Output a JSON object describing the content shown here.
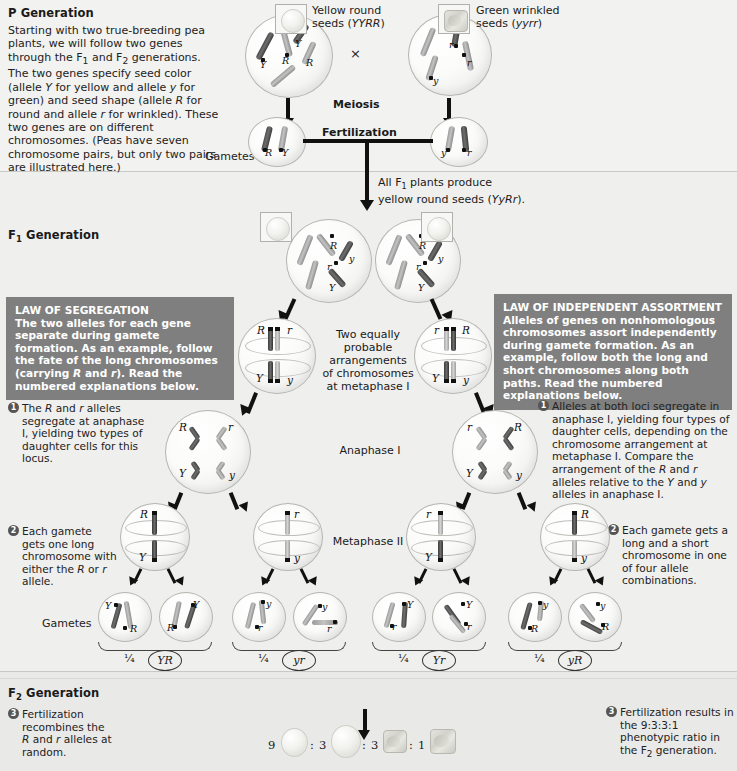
{
  "p_generation": {
    "heading": "P Generation",
    "heading_sub": "",
    "intro": "Starting with two true-breeding pea plants, we will follow two genes through the F1 and F2 generations. The two genes specify seed color (allele Y for yellow and allele y for green) and seed shape (allele R for round and allele r for wrinkled). These two genes are on different chromosomes. (Peas have seven chromosome pairs, but only two pairs are illustrated here.)",
    "parent_left_label": "Yellow round seeds (YYRR)",
    "parent_right_label": "Green wrinkled seeds (yyrr)",
    "cross_symbol": "×",
    "meiosis_label": "Meiosis",
    "fertilization_label": "Fertilization",
    "gametes_label": "Gametes",
    "parent_left_alleles": [
      "Y",
      "Y",
      "R",
      "R"
    ],
    "parent_right_alleles": [
      "y",
      "y",
      "r",
      "r"
    ],
    "gamete_left_alleles": [
      "R",
      "Y"
    ],
    "gamete_right_alleles": [
      "y",
      "r"
    ]
  },
  "f1_generation": {
    "heading": "F1 Generation",
    "all_f1_note": "All F1 plants produce yellow round seeds (YyRr).",
    "meiosis_label": "Meiosis",
    "metaphase1_note": "Two equally probable arrangements of chromosomes at metaphase I",
    "anaphase1_label": "Anaphase I",
    "metaphase2_label": "Metaphase II",
    "gametes_label": "Gametes",
    "f1_cell_alleles": [
      "R",
      "y",
      "r",
      "Y"
    ],
    "law_segregation": {
      "title": "LAW OF SEGREGATION",
      "body": "The two alleles for each gene separate during gamete formation. As an example, follow the fate of the long chromosomes (carrying R and r). Read the numbered explanations below."
    },
    "law_independent_assortment": {
      "title": "LAW OF INDEPENDENT ASSORTMENT",
      "body": "Alleles of genes on nonhomologous chromosomes assort independently during gamete formation. As an example, follow both the long and short chromosomes along both paths. Read the numbered explanations below."
    },
    "callout_left_1": {
      "number": "1",
      "text": "The R and r alleles segregate at anaphase I, yielding two types of daughter cells for this locus."
    },
    "callout_left_2": {
      "number": "2",
      "text": "Each gamete gets one long chromosome with either the R or r allele."
    },
    "callout_right_1": {
      "number": "1",
      "text": "Alleles at both loci segregate in anaphase I, yielding four types of daughter cells, depending on the chromosome arrangement at metaphase I. Compare the arrangement of the R and r alleles relative to the Y and y alleles in anaphase I."
    },
    "callout_right_2": {
      "number": "2",
      "text": "Each gamete gets a long and a short chromosome in one of four allele combinations."
    },
    "metaphase1_cells": [
      {
        "top_left": "R",
        "top_right": "r",
        "bottom_left": "Y",
        "bottom_right": "y"
      },
      {
        "top_left": "r",
        "top_right": "R",
        "bottom_left": "Y",
        "bottom_right": "y"
      }
    ],
    "anaphase1_cells": [
      {
        "top_left": "R",
        "top_right": "r",
        "bottom_left": "Y",
        "bottom_right": "y"
      },
      {
        "top_left": "r",
        "top_right": "R",
        "bottom_left": "Y",
        "bottom_right": "y"
      }
    ],
    "metaphase2_cells": [
      {
        "top": "R",
        "bottom": "Y"
      },
      {
        "top": "r",
        "bottom": "y"
      },
      {
        "top": "r",
        "bottom": "Y"
      },
      {
        "top": "R",
        "bottom": "y"
      }
    ],
    "gamete_groups": [
      {
        "fraction": "1/4",
        "genotype": "YR",
        "cells": [
          {
            "a": "Y",
            "b": "R"
          },
          {
            "a": "Y",
            "b": "R"
          }
        ]
      },
      {
        "fraction": "1/4",
        "genotype": "yr",
        "cells": [
          {
            "a": "y",
            "b": "r"
          },
          {
            "a": "y",
            "b": "r"
          }
        ]
      },
      {
        "fraction": "1/4",
        "genotype": "Yr",
        "cells": [
          {
            "a": "Y",
            "b": "r"
          },
          {
            "a": "Y",
            "b": "r"
          }
        ]
      },
      {
        "fraction": "1/4",
        "genotype": "yR",
        "cells": [
          {
            "a": "y",
            "b": "R"
          },
          {
            "a": "y",
            "b": "R"
          }
        ]
      }
    ]
  },
  "f2_generation": {
    "heading": "F2 Generation",
    "cross_box": "An F1 × F1 cross-fertilization",
    "callout_left": {
      "number": "3",
      "text": "Fertilization recombines the R and r alleles at random."
    },
    "callout_right": {
      "number": "3",
      "text": "Fertilization results in the 9:3:3:1 phenotypic ratio in the F2 generation."
    },
    "ratio": {
      "counts": [
        "9",
        "3",
        "3",
        "1"
      ],
      "separator": ":",
      "phenotypes": [
        "yellow-round",
        "green-round",
        "yellow-wrinkled",
        "green-wrinkled"
      ],
      "text": "9 : 3 : 3 : 1"
    }
  },
  "colors": {
    "law_box_bg": "#7f7f7f",
    "band_p": "#f2f2f0",
    "band_f1": "#efefed",
    "band_f2": "#e9e9e7",
    "text": "#1a1a1a"
  }
}
